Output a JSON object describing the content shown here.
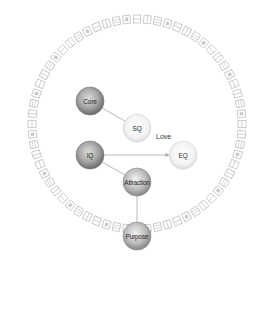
{
  "diagram": {
    "type": "concept-network",
    "ring": {
      "center": [
        137,
        124
      ],
      "radius": 105,
      "glyph_count": 64,
      "color": "#c8c8c8",
      "style": "ring of small pictograph glyphs"
    },
    "nodes": [
      {
        "id": "core",
        "label": "Core",
        "cx": 90,
        "cy": 101,
        "r": 14,
        "shade": "dark"
      },
      {
        "id": "sq",
        "label": "SQ",
        "cx": 137,
        "cy": 128,
        "r": 14,
        "shade": "light"
      },
      {
        "id": "iq",
        "label": "IQ",
        "cx": 90,
        "cy": 155,
        "r": 14,
        "shade": "dark"
      },
      {
        "id": "eq",
        "label": "EQ",
        "cx": 183,
        "cy": 155,
        "r": 14,
        "shade": "light"
      },
      {
        "id": "attraction",
        "label": "Attraction",
        "cx": 137,
        "cy": 182,
        "r": 14,
        "shade": "mid"
      },
      {
        "id": "purpose",
        "label": "Purpose",
        "cx": 137,
        "cy": 236,
        "r": 14,
        "shade": "mid"
      }
    ],
    "edges": [
      {
        "from": "core",
        "to": "sq",
        "label": ""
      },
      {
        "from": "iq",
        "to": "eq",
        "label": "",
        "arrow": true
      },
      {
        "from": "iq",
        "to": "attraction",
        "label": ""
      },
      {
        "from": "purpose",
        "to": "attraction",
        "label": ""
      }
    ],
    "annotations": [
      {
        "text": "Love",
        "x": 156,
        "y": 139
      }
    ],
    "colors": {
      "dark_fill_center": "#d9d9d9",
      "dark_fill_edge": "#6e6e6e",
      "mid_fill_center": "#ececec",
      "mid_fill_edge": "#8a8a8a",
      "light_fill_center": "#ffffff",
      "light_fill_edge": "#d6d6d6",
      "edge_color": "#a8a8a8"
    }
  }
}
